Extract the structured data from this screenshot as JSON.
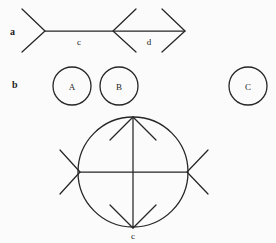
{
  "figure": {
    "background_color": "#fbfbfb",
    "stroke_color": "#262626",
    "width": 276,
    "height": 243,
    "panels": [
      {
        "id": "a",
        "panel_label": "a",
        "panel_label_x": 10,
        "panel_label_y": 35,
        "description": "horizontal axis with chevron arrowheads marking two segments",
        "segment_labels": [
          {
            "text": "c",
            "x": 79,
            "y": 45
          },
          {
            "text": "d",
            "x": 149,
            "y": 45
          }
        ]
      },
      {
        "id": "b",
        "panel_label": "b",
        "panel_label_x": 12,
        "panel_label_y": 88,
        "description": "three separate circles labeled A, B and C",
        "circles": [
          {
            "label": "A",
            "cx": 72,
            "cy": 86,
            "r": 19
          },
          {
            "label": "B",
            "cx": 119,
            "cy": 86,
            "r": 19
          },
          {
            "label": "C",
            "cx": 248,
            "cy": 86,
            "r": 19
          }
        ]
      },
      {
        "id": "c",
        "panel_label": "",
        "description": "large circle with a vertical double headed arrow and a horizontal line ending in outward chevrons",
        "main_circle": {
          "cx": 133,
          "cy": 172,
          "r": 55
        },
        "axis_label": {
          "text": "c",
          "x": 133,
          "y": 239
        }
      }
    ]
  },
  "geometry": {
    "panel_a": {
      "baseline_y": 31,
      "left_chevron_vertex_x": 45,
      "left_chevron_top": {
        "x": 22,
        "y": 9
      },
      "left_chevron_bottom": {
        "x": 22,
        "y": 52
      },
      "mid_chevron_vertex_x": 113,
      "mid_chevron_top": {
        "x": 136,
        "y": 9
      },
      "mid_chevron_bottom": {
        "x": 136,
        "y": 52
      },
      "right_arrow_vertex_x": 185,
      "right_arrow_top": {
        "x": 162,
        "y": 9
      },
      "right_arrow_bottom": {
        "x": 162,
        "y": 52
      },
      "line_start_x": 45,
      "line_end_x": 185
    },
    "panel_c": {
      "vertical_top": {
        "x": 133,
        "y": 117
      },
      "vertical_bottom": {
        "x": 133,
        "y": 228
      },
      "horizontal_left": {
        "x": 62,
        "y": 172
      },
      "horizontal_right": {
        "x": 205,
        "y": 172
      },
      "top_arrowhead": [
        {
          "x": 110,
          "y": 140
        },
        {
          "x": 156,
          "y": 140
        }
      ],
      "bottom_arrowhead": [
        {
          "x": 110,
          "y": 205
        },
        {
          "x": 156,
          "y": 205
        }
      ],
      "left_chevron": [
        {
          "x": 60,
          "y": 150
        },
        {
          "x": 60,
          "y": 194
        }
      ],
      "left_chevron_vertex": {
        "x": 80,
        "y": 172
      },
      "right_chevron": [
        {
          "x": 208,
          "y": 150
        },
        {
          "x": 208,
          "y": 194
        }
      ],
      "right_chevron_vertex": {
        "x": 187,
        "y": 172
      }
    }
  }
}
